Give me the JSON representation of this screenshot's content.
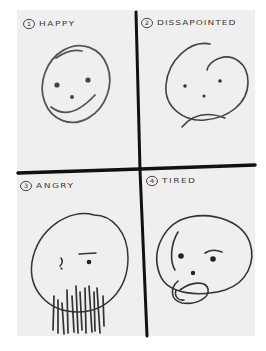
{
  "image": {
    "description": "Hand-drawn sketch on paper divided into four quadrants showing emotional faces",
    "colors": {
      "paper": "#efefef",
      "ink": "#2a2a2a",
      "background": "#ffffff"
    }
  },
  "quadrants": [
    {
      "number": "1",
      "label": "HAPPY",
      "expression": "smile"
    },
    {
      "number": "2",
      "label": "DISSAPOINTED",
      "expression": "frown"
    },
    {
      "number": "3",
      "label": "ANGRY",
      "expression": "angry-with-beard"
    },
    {
      "number": "4",
      "label": "TIRED",
      "expression": "tired-with-open-mouth"
    }
  ]
}
